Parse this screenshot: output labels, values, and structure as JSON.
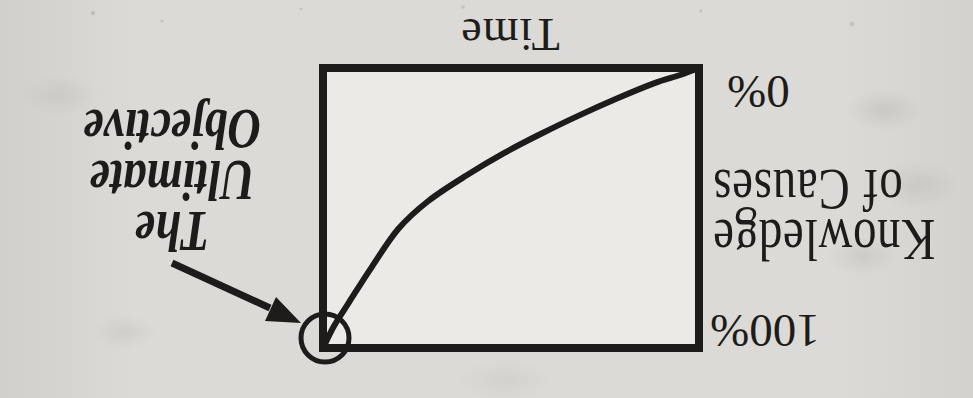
{
  "page": {
    "rotation_deg": 180,
    "paper_color": "#dbdad6",
    "plot_fill": "#ebeae6",
    "ink_color": "#1d1c1a"
  },
  "labels": {
    "time": "Time",
    "zero_percent": "0%",
    "hundred_percent": "100%",
    "knowledge_line1": "Knowledge",
    "knowledge_line2": "of Causes",
    "objective_line1": "The Ultimate",
    "objective_line2": "Objective"
  },
  "chart_data": {
    "type": "line",
    "title": "",
    "xlabel": "Time",
    "ylabel": "Knowledge of Causes",
    "x_axis": {
      "label": "Time",
      "range_normalized": [
        0,
        1
      ],
      "tick_labels": []
    },
    "y_axis": {
      "label": "Knowledge of Causes",
      "unit": "%",
      "range": [
        0,
        100
      ],
      "tick_labels": [
        "0%",
        "100%"
      ]
    },
    "grid": false,
    "legend": null,
    "series": [
      {
        "name": "knowledge-of-causes-over-time",
        "x_normalized": [
          0,
          0.05,
          0.12,
          0.22,
          0.32,
          0.42,
          0.52,
          0.62,
          0.72,
          0.8,
          0.87,
          0.93,
          0.97,
          1.0
        ],
        "y_percent": [
          0,
          2.5,
          5.5,
          11,
          17,
          23.5,
          30.5,
          38.5,
          47.5,
          57.5,
          71,
          83.5,
          92,
          100
        ]
      }
    ],
    "annotation": {
      "label": "The Ultimate Objective",
      "target_x_normalized": 1.0,
      "target_y_percent": 100,
      "marker": "circle",
      "arrow": true
    }
  }
}
